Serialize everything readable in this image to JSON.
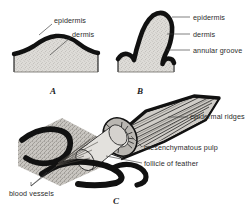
{
  "figure": {
    "background": "#ffffff",
    "ink": "#111111",
    "tissue_fill": "#d8d6d2",
    "label_color": "#2b2b2b"
  },
  "panels": [
    {
      "id": "A",
      "letter": "A",
      "letter_x": 50,
      "letter_y": 86,
      "caption": "feather papilla, early bud stage",
      "labels": [
        {
          "text": "epidermis",
          "x": 54,
          "y": 17,
          "leader": {
            "x1": 52,
            "y1": 24,
            "x2": 39,
            "y2": 35
          }
        },
        {
          "text": "dermis",
          "x": 72,
          "y": 31,
          "leader": {
            "x1": 71,
            "y1": 37,
            "x2": 50,
            "y2": 55
          }
        }
      ]
    },
    {
      "id": "B",
      "letter": "B",
      "letter_x": 137,
      "letter_y": 86,
      "caption": "elongating feather germ with annular groove",
      "labels": [
        {
          "text": "epidermis",
          "x": 193,
          "y": 14,
          "leader": {
            "x1": 190,
            "y1": 17,
            "x2": 172,
            "y2": 17
          }
        },
        {
          "text": "dermis",
          "x": 193,
          "y": 31,
          "leader": {
            "x1": 190,
            "y1": 34,
            "x2": 167,
            "y2": 34
          }
        },
        {
          "text": "annular groove",
          "x": 193,
          "y": 47,
          "leader": {
            "x1": 190,
            "y1": 50,
            "x2": 167,
            "y2": 50
          }
        }
      ]
    },
    {
      "id": "C",
      "letter": "C",
      "letter_x": 113,
      "letter_y": 196,
      "caption": "feather within its follicle, cut away to show pulp and ridges",
      "labels": [
        {
          "text": "epidermal ridges",
          "x": 190,
          "y": 113,
          "leader": {
            "x1": 188,
            "y1": 117,
            "x2": 168,
            "y2": 117
          }
        },
        {
          "text": "mesenchymatous pulp",
          "x": 144,
          "y": 144,
          "leader": {
            "x1": 142,
            "y1": 147,
            "x2": 131,
            "y2": 136
          }
        },
        {
          "text": "follicle of feather",
          "x": 144,
          "y": 160,
          "leader": {
            "x1": 142,
            "y1": 163,
            "x2": 106,
            "y2": 156
          }
        },
        {
          "text": "blood vessels",
          "x": 9,
          "y": 190,
          "leader": {
            "x1": 31,
            "y1": 186,
            "x2": 57,
            "y2": 168
          }
        }
      ]
    }
  ]
}
